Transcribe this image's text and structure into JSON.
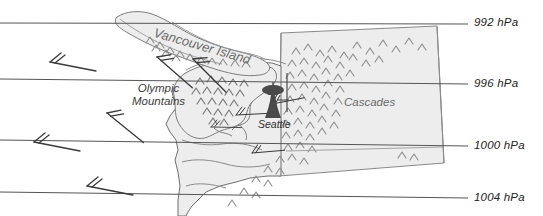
{
  "figure": {
    "background_color": "#ffffff",
    "land_fill_color": "#e9e9e9",
    "terrain_stroke_color": "#8a8a8a",
    "isobar_color": "#555555",
    "wind_barb_color": "#3a3a3a",
    "city_symbol_color": "#3a3a3a"
  },
  "isobars": [
    {
      "id": "isobar-992",
      "value": "992 hPa",
      "pressure": 992,
      "label_x": 474,
      "label_y": 18,
      "y_left": 23,
      "y_right": 24
    },
    {
      "id": "isobar-996",
      "value": "996 hPa",
      "pressure": 996,
      "label_x": 474,
      "label_y": 78,
      "y_left": 79,
      "y_right": 84
    },
    {
      "id": "isobar-1000",
      "value": "1000 hPa",
      "pressure": 1000,
      "label_x": 474,
      "label_y": 140,
      "y_left": 140,
      "y_right": 146
    },
    {
      "id": "isobar-1004",
      "value": "1004 hPa",
      "pressure": 1004,
      "label_x": 474,
      "label_y": 192,
      "y_left": 192,
      "y_right": 198
    }
  ],
  "map_labels": {
    "vancouver_island": "Vancouver Island",
    "olympic_mountains_line1": "Olympic",
    "olympic_mountains_line2": "Mountains",
    "cascades": "Cascades",
    "seattle": "Seattle"
  },
  "features": {
    "city_symbol_name": "space-needle-icon",
    "wind_barb_count": 10,
    "wind_barbs": [
      {
        "id": "wind-barb-1",
        "x": 50,
        "y": 62
      },
      {
        "id": "wind-barb-2",
        "x": 34,
        "y": 142
      },
      {
        "id": "wind-barb-3",
        "x": 87,
        "y": 186
      },
      {
        "id": "wind-barb-4",
        "x": 107,
        "y": 113
      },
      {
        "id": "wind-barb-5",
        "x": 157,
        "y": 57
      },
      {
        "id": "wind-barb-6",
        "x": 193,
        "y": 59
      },
      {
        "id": "wind-barb-7",
        "x": 211,
        "y": 127
      },
      {
        "id": "wind-barb-8",
        "x": 236,
        "y": 115
      },
      {
        "id": "wind-barb-9",
        "x": 252,
        "y": 153
      },
      {
        "id": "wind-barb-10",
        "x": 272,
        "y": 104
      }
    ]
  }
}
